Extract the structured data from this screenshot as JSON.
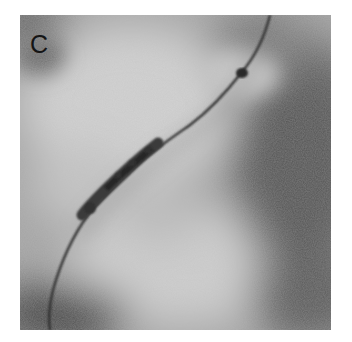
{
  "figure": {
    "panel_label": "C",
    "colors": {
      "background": "#ffffff",
      "base_gray": "#a8a8a8",
      "light_region": "#d8d8d8",
      "dark_region": "#4a4a4a",
      "wire": "#2a2a2a",
      "stent": "#353535"
    }
  }
}
